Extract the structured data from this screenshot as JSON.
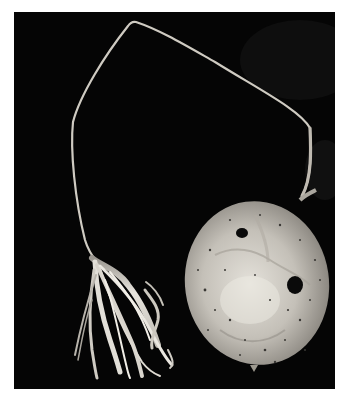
{
  "image": {
    "kind": "photograph",
    "description": "Black-and-white photograph of a dried round gourd with a long thin looping stem ending in a frayed fibrous tassel, against a black background",
    "colors": {
      "background_page": "#ffffff",
      "background_photo": "#050505",
      "gourd_light": "#d9d6cf",
      "gourd_mid": "#a8a49c",
      "stem": "#c9c5bc",
      "fibers": "#e6e3dc",
      "holes": "#0a0a0a"
    },
    "subjects": [
      {
        "name": "gourd",
        "shape": "round",
        "features": [
          "two dark holes",
          "speckled surface"
        ]
      },
      {
        "name": "stem",
        "shape": "thin loop"
      },
      {
        "name": "fiber-tassel",
        "shape": "frayed strands"
      }
    ]
  }
}
